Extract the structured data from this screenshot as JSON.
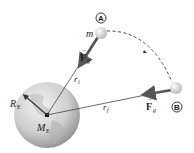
{
  "diagram": {
    "type": "gravitational-work-diagram",
    "earth": {
      "radius_label": "R",
      "radius_sub": "E",
      "mass_label": "M",
      "mass_sub": "E"
    },
    "points": {
      "A": {
        "label": "A",
        "mass_label": "m"
      },
      "B": {
        "label": "B"
      }
    },
    "force": {
      "label": "F",
      "sub": "g",
      "arrow": "→"
    },
    "distances": {
      "initial": {
        "label": "r",
        "sub": "i"
      },
      "final": {
        "label": "r",
        "sub": "f"
      }
    },
    "colors": {
      "earth_light": "#e8e8e8",
      "earth_dark": "#9a9a9a",
      "ball": "#d8d8d8",
      "force_arrow": "#555555",
      "lines": "#444444"
    }
  }
}
